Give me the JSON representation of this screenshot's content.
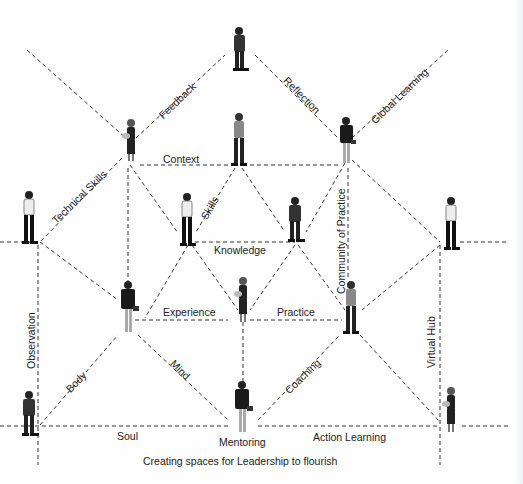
{
  "diagram": {
    "caption": "Creating spaces for Leadership to flourish",
    "edge_labels": {
      "feedback": "Feedback",
      "reflection": "Reflection",
      "global_learning": "Global Learning",
      "context": "Context",
      "technical_skills": "Technical Skills",
      "skills": "Skills",
      "knowledge": "Knowledge",
      "community_of_practice": "Community of Practice",
      "experience": "Experience",
      "practice": "Practice",
      "observation": "Observation",
      "body": "Body",
      "mind": "Mind",
      "coaching": "Coaching",
      "virtual_hub": "Virtual Hub",
      "soul": "Soul",
      "mentoring": "Mentoring",
      "action_learning": "Action Learning"
    },
    "nodes": [
      {
        "id": "top",
        "figure": "man-suit-arms-crossed"
      },
      {
        "id": "upper-left",
        "figure": "woman-with-bag"
      },
      {
        "id": "upper-center",
        "figure": "man-casual"
      },
      {
        "id": "upper-right",
        "figure": "woman-suit"
      },
      {
        "id": "left",
        "figure": "man-shirt"
      },
      {
        "id": "skills",
        "figure": "man-shirt"
      },
      {
        "id": "center-right",
        "figure": "man-suit-arms-crossed"
      },
      {
        "id": "right",
        "figure": "man-shirt"
      },
      {
        "id": "experience",
        "figure": "woman-suit"
      },
      {
        "id": "center",
        "figure": "woman-with-bag"
      },
      {
        "id": "practice",
        "figure": "man-casual"
      },
      {
        "id": "bottom-left",
        "figure": "man-suit-arms-crossed"
      },
      {
        "id": "mentoring",
        "figure": "woman-suit"
      },
      {
        "id": "bottom-right",
        "figure": "woman-with-bag"
      }
    ]
  }
}
